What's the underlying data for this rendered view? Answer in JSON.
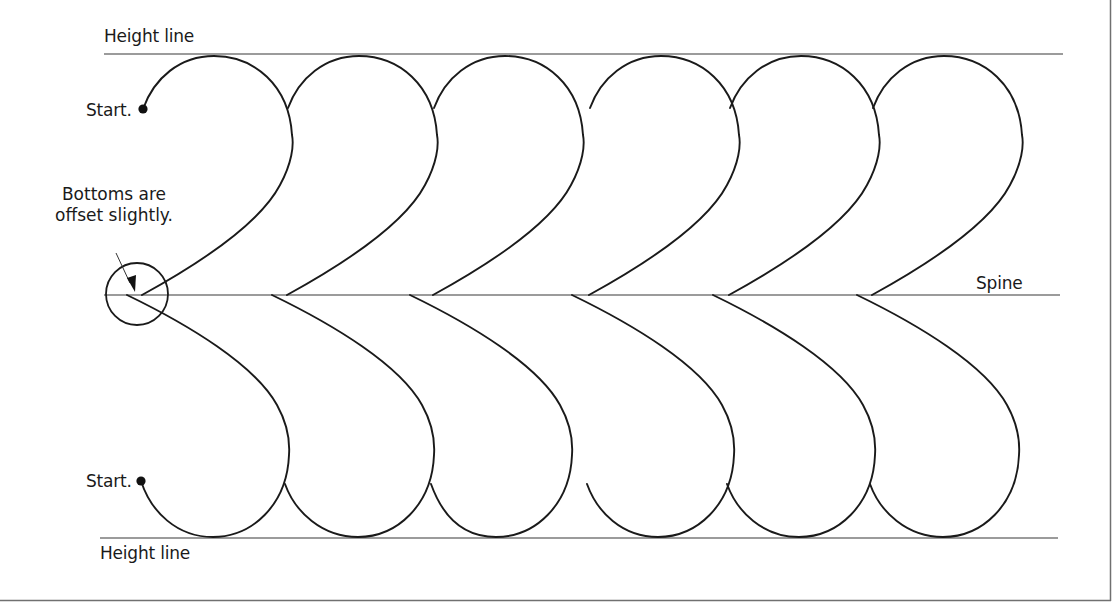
{
  "diagram": {
    "type": "feather-quilting-motif",
    "labels": {
      "top_height_line": "Height line",
      "bottom_height_line": "Height line",
      "top_start": "Start.",
      "bottom_start": "Start.",
      "spine": "Spine",
      "callout_line1": "Bottoms are",
      "callout_line2": "offset slightly."
    },
    "geometry": {
      "top_height_line_y": 54,
      "spine_y": 295,
      "bottom_height_line_y": 538,
      "top_plume_starts_x": [
        142,
        287,
        433,
        589,
        729,
        872
      ],
      "bottom_plume_starts_x": [
        127,
        272,
        410,
        572,
        713,
        857
      ],
      "plume_count_top": 6,
      "plume_count_bottom": 6
    },
    "colors": {
      "stroke": "#1a1a1a",
      "guide_line": "#7a7a7a",
      "border": "#6e6e6e"
    }
  }
}
